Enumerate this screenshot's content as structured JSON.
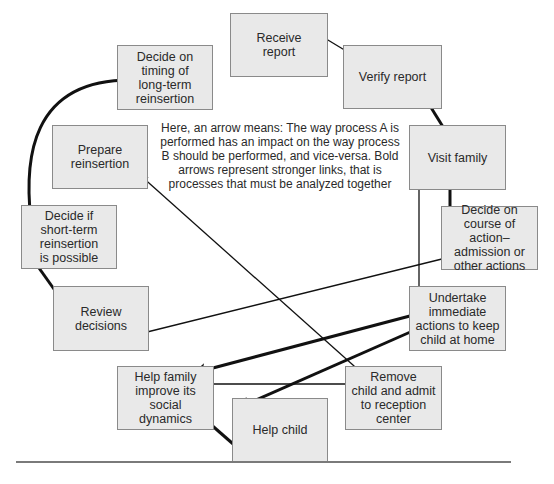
{
  "diagram": {
    "legend": "Here, an arrow means: The way process A is performed has an impact on the way process B should be performed, and vice-versa. Bold arrows represent stronger links, that is processes that must be analyzed together",
    "nodes": {
      "receive_report": "Receive\nreport",
      "verify_report": "Verify report",
      "visit_family": "Visit family",
      "decide_course": "Decide on\ncourse of action–\nadmission or\nother actions",
      "undertake_actions": "Undertake\nimmediate\nactions to keep\nchild at home",
      "remove_child": "Remove\nchild and admit\nto reception\ncenter",
      "help_child": "Help child",
      "help_family": "Help family\nimprove its\nsocial\ndynamics",
      "review_decisions": "Review\ndecisions",
      "decide_short_term": "Decide if\nshort-term\nreinsertion\nis possible",
      "prepare_reinsertion": "Prepare\nreinsertion",
      "decide_timing": "Decide on\ntiming of\nlong-term\nreinsertion"
    },
    "edges": [
      {
        "from": "receive_report",
        "to": "verify_report",
        "bold": false
      },
      {
        "from": "verify_report",
        "to": "visit_family",
        "bold": true
      },
      {
        "from": "visit_family",
        "to": "decide_course",
        "bold": true
      },
      {
        "from": "visit_family",
        "to": "undertake_actions",
        "bold": false
      },
      {
        "from": "decide_course",
        "to": "review_decisions",
        "bold": false
      },
      {
        "from": "undertake_actions",
        "to": "help_family",
        "bold": true
      },
      {
        "from": "undertake_actions",
        "to": "help_child",
        "bold": true
      },
      {
        "from": "prepare_reinsertion",
        "to": "remove_child",
        "bold": false
      },
      {
        "from": "help_family",
        "to": "remove_child",
        "bold": false
      },
      {
        "from": "help_family",
        "to": "help_child",
        "bold": true
      },
      {
        "from": "review_decisions",
        "to": "decide_short_term",
        "bold": true
      },
      {
        "from": "decide_short_term",
        "to": "decide_timing",
        "bold": true
      }
    ],
    "colors": {
      "box_fill": "#e9e9e9",
      "box_border": "#8a8a8a",
      "arrow": "#111111"
    }
  }
}
